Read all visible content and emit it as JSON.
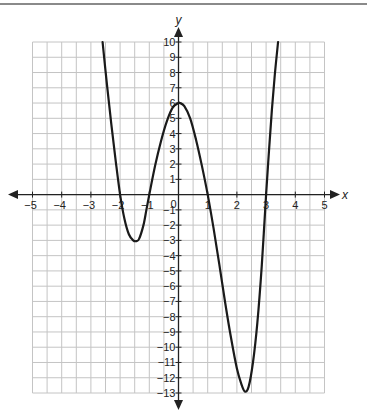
{
  "figure": {
    "x_axis_label": "x",
    "y_axis_label": "y",
    "origin_label": "0"
  },
  "colors": {
    "grid": "#c4c4c4",
    "axis": "#222222",
    "curve": "#1a1a1a",
    "top_rule": "#8a8a8a"
  },
  "chart_data": {
    "type": "line",
    "title": "",
    "xlabel": "x",
    "ylabel": "y",
    "xlim": [
      -5,
      5
    ],
    "ylim": [
      -13,
      10
    ],
    "grid": true,
    "grid_step_x": 0.5,
    "grid_step_y": 1,
    "x_ticks": [
      -5,
      -4,
      -3,
      -2,
      -1,
      0,
      1,
      2,
      3,
      4,
      5
    ],
    "y_ticks": [
      -13,
      -12,
      -11,
      -10,
      -9,
      -8,
      -7,
      -6,
      -5,
      -4,
      -3,
      -2,
      -1,
      1,
      2,
      3,
      4,
      5,
      6,
      7,
      8,
      9,
      10
    ],
    "legend": null,
    "annotations": [],
    "series": [
      {
        "name": "f(x)",
        "description": "Quartic curve with x-intercepts at -2, -1, 1, 3; local min ≈ (-1.45, -3.05), local max ≈ (0.05, 6), min ≈ (2.27, -12.9); exits top of grid near x ≈ -2.6 and x ≈ 3.4",
        "x": [
          -2.6,
          -2.45,
          -2.3,
          -2.15,
          -2.0,
          -1.85,
          -1.7,
          -1.55,
          -1.45,
          -1.35,
          -1.2,
          -1.1,
          -1.0,
          -0.8,
          -0.6,
          -0.4,
          -0.2,
          0.0,
          0.05,
          0.2,
          0.4,
          0.6,
          0.8,
          1.0,
          1.2,
          1.4,
          1.6,
          1.8,
          2.0,
          2.15,
          2.27,
          2.4,
          2.55,
          2.7,
          2.85,
          3.0,
          3.1,
          3.2,
          3.3,
          3.41
        ],
        "y": [
          10,
          7.2,
          4.6,
          2.2,
          0,
          -1.6,
          -2.6,
          -3.0,
          -3.05,
          -2.9,
          -2.0,
          -1.0,
          0,
          1.9,
          3.5,
          4.8,
          5.7,
          6.0,
          6.0,
          5.8,
          5.0,
          3.6,
          1.9,
          0,
          -2.2,
          -4.6,
          -7.1,
          -9.4,
          -11.4,
          -12.4,
          -12.9,
          -12.6,
          -11.0,
          -8.4,
          -4.7,
          0,
          2.9,
          5.6,
          7.9,
          10
        ]
      }
    ],
    "x_intercepts": [
      -2,
      -1,
      1,
      3
    ],
    "y_intercept": 6
  }
}
